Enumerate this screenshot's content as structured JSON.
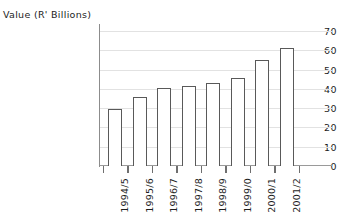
{
  "chart_data": {
    "type": "bar",
    "title": "",
    "xlabel": "",
    "ylabel": "Value (R' Billions)",
    "categories": [
      "1994/5",
      "1995/6",
      "1996/7",
      "1997/8",
      "1998/9",
      "1999/0",
      "2000/1",
      "2001/2"
    ],
    "values": [
      29.5,
      36,
      40.5,
      41.5,
      43,
      45.5,
      55,
      61
    ],
    "series": [
      {
        "name": "Value",
        "values": [
          29.5,
          36,
          40.5,
          41.5,
          43,
          45.5,
          55,
          61
        ]
      }
    ],
    "ylim": [
      0,
      70
    ],
    "ytick_labels": [
      "70",
      "60",
      "50",
      "40",
      "30",
      "20",
      "10",
      "0"
    ],
    "ytick_values": [
      70,
      60,
      50,
      40,
      30,
      20,
      10,
      0
    ],
    "ytick_interval": 10,
    "grid": "horizontal",
    "legend": "none",
    "bar_fill_color": "#ffffff",
    "bar_border_color": "#595959",
    "gridline_color": "#e2e2e2",
    "axis_color": "#8c8c8c",
    "text_color": "#1d1d1d",
    "background_color": "#ffffff"
  }
}
